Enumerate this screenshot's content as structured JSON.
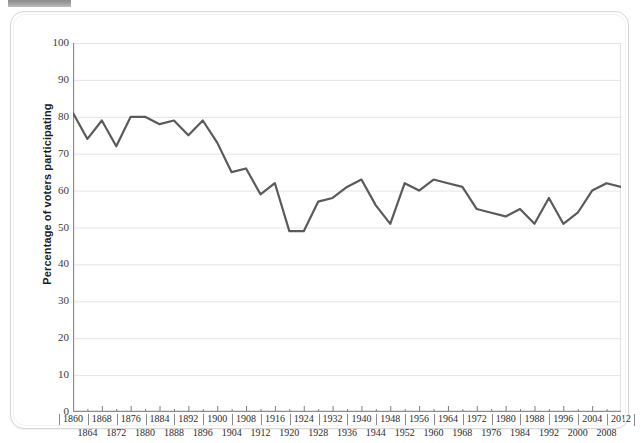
{
  "figure": {
    "artifact_label": "",
    "y_axis_title": "Percentage of voters participating"
  },
  "chart_data": {
    "type": "line",
    "title": "",
    "xlabel": "",
    "ylabel": "Percentage of voters participating",
    "ylim": [
      0,
      100
    ],
    "ytick_step": 10,
    "yticks": [
      0,
      10,
      20,
      30,
      40,
      50,
      60,
      70,
      80,
      90,
      100
    ],
    "xlim": [
      1860,
      2012
    ],
    "grid": true,
    "legend": false,
    "line_color": "#5a5a5a",
    "categories": [
      "1860",
      "1864",
      "1868",
      "1872",
      "1876",
      "1880",
      "1884",
      "1888",
      "1892",
      "1896",
      "1900",
      "1904",
      "1908",
      "1912",
      "1916",
      "1920",
      "1924",
      "1928",
      "1932",
      "1936",
      "1940",
      "1944",
      "1948",
      "1952",
      "1956",
      "1960",
      "1964",
      "1968",
      "1972",
      "1976",
      "1980",
      "1984",
      "1988",
      "1992",
      "1996",
      "2000",
      "2004",
      "2008",
      "2012"
    ],
    "values": [
      81,
      74,
      79,
      72,
      80,
      80,
      78,
      79,
      75,
      79,
      73,
      65,
      66,
      59,
      62,
      49,
      49,
      57,
      58,
      61,
      63,
      56,
      51,
      62,
      60,
      63,
      62,
      61,
      55,
      54,
      53,
      55,
      51,
      58,
      51,
      54,
      60,
      62,
      61
    ],
    "annotations": []
  }
}
